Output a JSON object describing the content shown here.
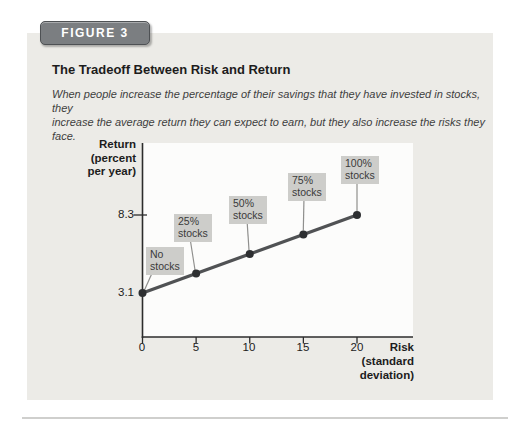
{
  "figure_badge": "FIGURE 3",
  "header": {
    "title": "The Tradeoff Between Risk and Return",
    "caption": "When people increase the percentage of their savings that they have invested in stocks, they\nincrease the average return they can expect to earn, but they also increase the risks they face."
  },
  "chart_data": {
    "type": "line",
    "title": "The Tradeoff Between Risk and Return",
    "xlabel": "Risk\n(standard\ndeviation)",
    "ylabel": "Return\n(percent\nper year)",
    "x": [
      0,
      5,
      10,
      15,
      20
    ],
    "y": [
      3.1,
      4.4,
      5.7,
      7.0,
      8.3
    ],
    "x_ticks": [
      "0",
      "5",
      "10",
      "15",
      "20"
    ],
    "y_ticks": [
      "8.3",
      "3.1"
    ],
    "y_tick_values": [
      8.3,
      3.1
    ],
    "point_labels": [
      "No\nstocks",
      "25%\nstocks",
      "50%\nstocks",
      "75%\nstocks",
      "100%\nstocks"
    ],
    "xlim": [
      0,
      25.2
    ],
    "grid": false,
    "legend": "none"
  },
  "colors": {
    "panel-bg": "#ecebe7",
    "plot-bg": "#fcfcfb",
    "badge-bg": "#7b7e81",
    "badge-border": "#4e5154",
    "box-bg": "#cdcdca",
    "line-color": "#505254",
    "point-color": "#2d2f31",
    "leader-color": "#8f8f8d",
    "axis-color": "#2c2c2c",
    "text-color": "#1c1c1c",
    "caption-color": "#3e3e3e",
    "hairline": "#cfcfcd"
  }
}
